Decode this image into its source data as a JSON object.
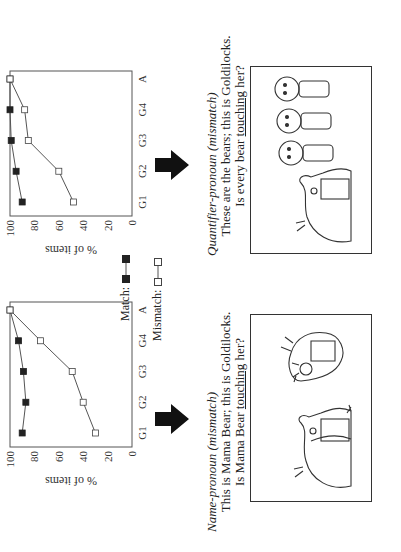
{
  "figure": {
    "legend": {
      "match_label": "Match:",
      "mismatch_label": "Mismatch:"
    },
    "y_axis_label": "% of items",
    "y_ticks": [
      "0",
      "20",
      "40",
      "60",
      "80",
      "100"
    ],
    "x_ticks": [
      "G1",
      "G2",
      "G3",
      "G4",
      "A"
    ],
    "panels": [
      {
        "id": "name-pronoun",
        "title": "Name-pronoun (mismatch)",
        "line1": "This is Mama Bear; this is Goldilocks.",
        "line2_prefix": "Is Mama Bear ",
        "line2_underlined": "touching",
        "line2_suffix": " her?"
      },
      {
        "id": "quantifier-pronoun",
        "title": "Quantifier-pronoun (mismatch)",
        "line1": "These are the bears; this is Goldilocks.",
        "line2_prefix": "Is every bear ",
        "line2_underlined": "touching",
        "line2_suffix": " her?"
      }
    ],
    "colors": {
      "match_marker": "#222222",
      "mismatch_marker": "#ffffff",
      "line": "#555555",
      "axis": "#555555",
      "arrow": "#111111"
    }
  },
  "chart_data": [
    {
      "type": "line",
      "title": "Name-pronoun (mismatch)",
      "categories": [
        "G1",
        "G2",
        "G3",
        "G4",
        "A"
      ],
      "series": [
        {
          "name": "Match",
          "values": [
            90,
            87,
            89,
            93,
            100
          ]
        },
        {
          "name": "Mismatch",
          "values": [
            30,
            40,
            49,
            75,
            100
          ]
        }
      ],
      "xlabel": "",
      "ylabel": "% of items",
      "ylim": [
        0,
        100
      ],
      "yticks": [
        0,
        20,
        40,
        60,
        80,
        100
      ],
      "grid": false,
      "legend_position": "between panels"
    },
    {
      "type": "line",
      "title": "Quantifier-pronoun (mismatch)",
      "categories": [
        "G1",
        "G2",
        "G3",
        "G4",
        "A"
      ],
      "series": [
        {
          "name": "Match",
          "values": [
            90,
            95,
            99,
            100,
            100
          ]
        },
        {
          "name": "Mismatch",
          "values": [
            48,
            60,
            85,
            88,
            100
          ]
        }
      ],
      "xlabel": "",
      "ylabel": "% of items",
      "ylim": [
        0,
        100
      ],
      "yticks": [
        0,
        20,
        40,
        60,
        80,
        100
      ],
      "grid": false,
      "legend_position": "between panels"
    }
  ]
}
